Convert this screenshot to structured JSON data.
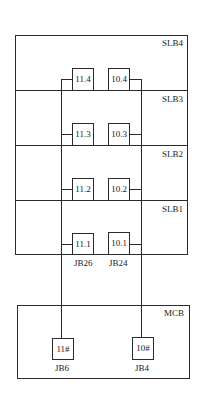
{
  "outer_frame": {
    "sections": [
      {
        "label": "SLB4"
      },
      {
        "label": "SLB3"
      },
      {
        "label": "SLB2"
      },
      {
        "label": "SLB1"
      }
    ]
  },
  "junction_boxes": {
    "left": [
      "11.4",
      "11.3",
      "11.2",
      "11.1"
    ],
    "right": [
      "10.4",
      "10.3",
      "10.2",
      "10.1"
    ]
  },
  "bottom_labels": {
    "left": "JB26",
    "right": "JB24"
  },
  "mcb": {
    "label": "MCB",
    "left_box": "11#",
    "left_box_label": "JB6",
    "right_box": "10#",
    "right_box_label": "JB4"
  }
}
